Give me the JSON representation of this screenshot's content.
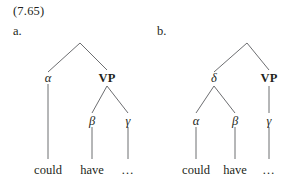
{
  "figure": {
    "number": "(7.65)",
    "items": [
      {
        "key": "a",
        "label": "a."
      },
      {
        "key": "b",
        "label": "b."
      }
    ]
  },
  "colors": {
    "background": "#ffffff",
    "text": "#231f20",
    "branch_line": "#6d6e71"
  },
  "tree_a": {
    "nodes": {
      "root": "",
      "left": "α",
      "right": "VP",
      "vp_left": "β",
      "vp_right": "γ"
    },
    "leaves": {
      "first": "could",
      "second": "have",
      "third": "…"
    }
  },
  "tree_b": {
    "nodes": {
      "root": "",
      "left": "δ",
      "right": "VP",
      "delta_left": "α",
      "delta_right": "β",
      "vp_child": "γ"
    },
    "leaves": {
      "first": "could",
      "second": "have",
      "third": "…"
    }
  }
}
